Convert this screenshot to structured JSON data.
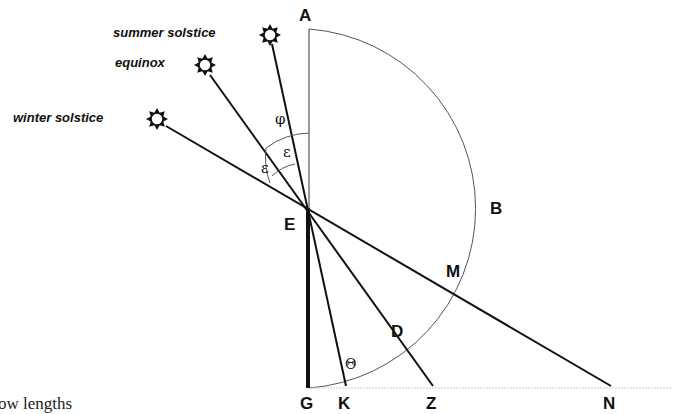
{
  "diagram": {
    "sun_labels": {
      "summer": "summer solstice",
      "equinox": "equinox",
      "winter": "winter solstice"
    },
    "points": {
      "A": "A",
      "B": "B",
      "E": "E",
      "M": "M",
      "D": "D",
      "G": "G",
      "K": "K",
      "Z": "Z",
      "N": "N"
    },
    "angles": {
      "phi": "φ",
      "epsilon_1": "ε",
      "epsilon_2": "ε",
      "theta": "Θ"
    },
    "caption_fragment": "ow lengths"
  }
}
